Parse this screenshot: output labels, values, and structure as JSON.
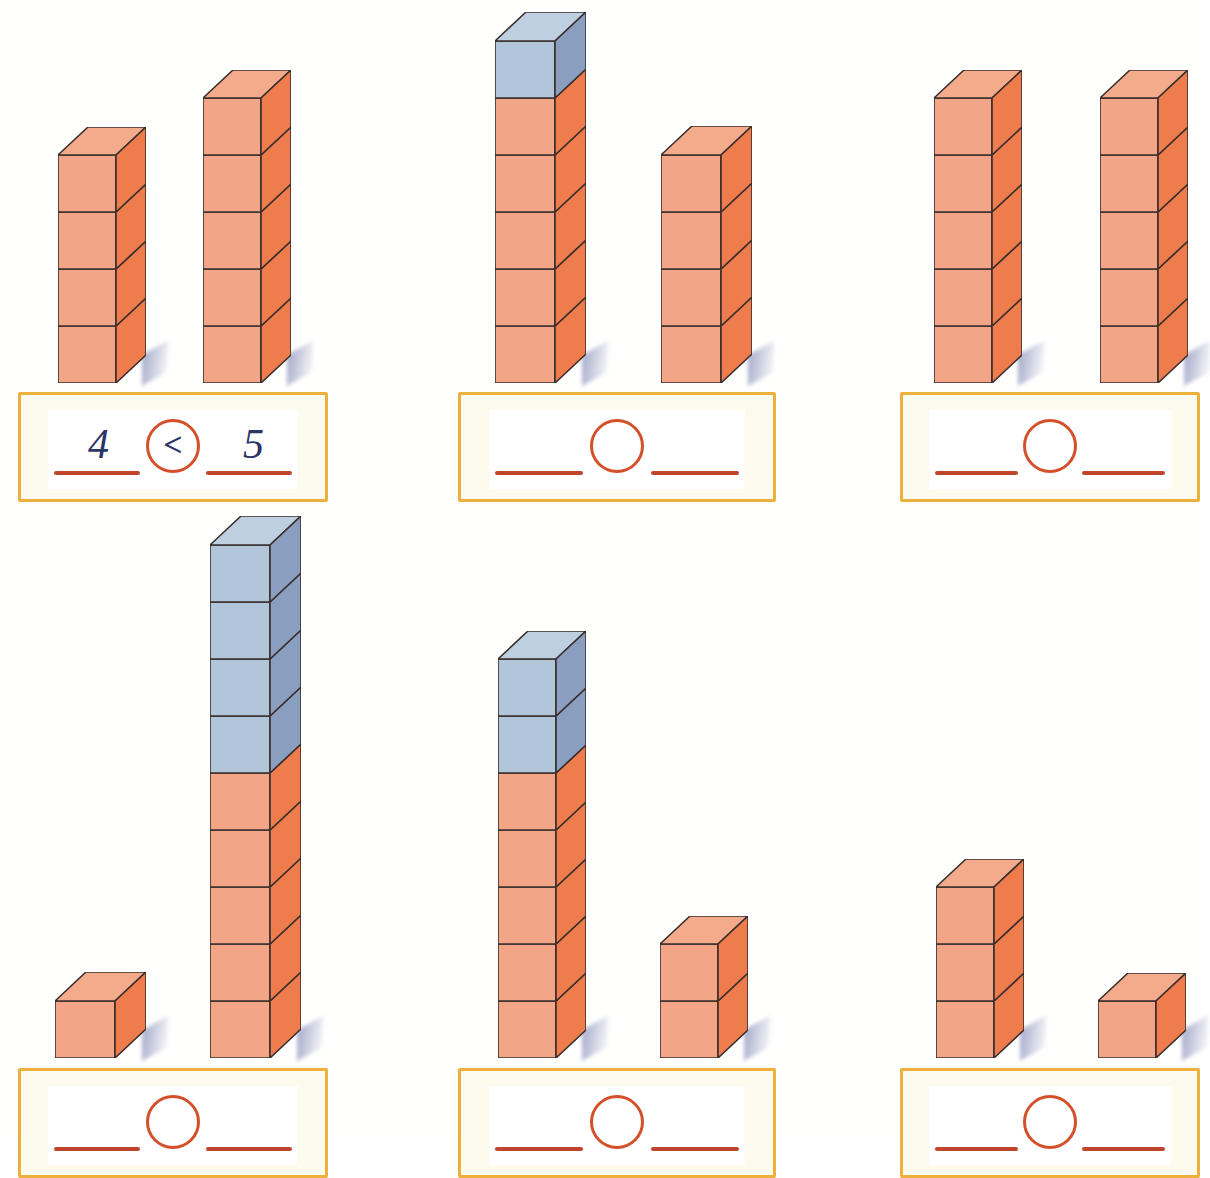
{
  "page": {
    "background_color": "#ffffff"
  },
  "palette": {
    "orange_front": "#f2a687",
    "orange_side": "#ef7c4c",
    "orange_top": "#f3ab8c",
    "blue_front": "#b2c6da",
    "blue_side": "#8a9fc0",
    "blue_top": "#bdcfe0",
    "outline": "#3a2f2c",
    "box_border": "#eeb03c",
    "box_fill": "#fdfbee",
    "blank_line": "#c0452a",
    "circle_stroke": "#d4502a",
    "ink": "#2b3566",
    "shadow": "#6a74a8"
  },
  "chart_data": {
    "type": "bar",
    "xlabel": "",
    "ylabel": "number of cubes",
    "categories": [
      "1-left",
      "1-right",
      "2-left",
      "2-right",
      "3-left",
      "3-right",
      "4-left",
      "4-right",
      "5-left",
      "5-right",
      "6-left",
      "6-right"
    ],
    "values": [
      4,
      5,
      6,
      4,
      5,
      5,
      1,
      9,
      7,
      2,
      3,
      1
    ],
    "series": [
      {
        "name": "orange cubes",
        "values": [
          4,
          5,
          5,
          4,
          5,
          5,
          1,
          5,
          5,
          2,
          3,
          1
        ]
      },
      {
        "name": "blue cubes",
        "values": [
          0,
          0,
          1,
          0,
          0,
          0,
          0,
          4,
          2,
          0,
          0,
          0
        ]
      }
    ],
    "legend": [
      "orange cubes",
      "blue cubes"
    ],
    "grid": false,
    "ylim": [
      0,
      9
    ]
  },
  "exercises": [
    {
      "id": "exercise-1",
      "left_tower": {
        "orange": 4,
        "blue": 0,
        "total": 4
      },
      "right_tower": {
        "orange": 5,
        "blue": 0,
        "total": 5
      },
      "answer": {
        "left_value": "4",
        "operator": "<",
        "right_value": "5",
        "filled": true
      }
    },
    {
      "id": "exercise-2",
      "left_tower": {
        "orange": 5,
        "blue": 1,
        "total": 6
      },
      "right_tower": {
        "orange": 4,
        "blue": 0,
        "total": 4
      },
      "answer": {
        "left_value": "",
        "operator": "",
        "right_value": "",
        "filled": false
      }
    },
    {
      "id": "exercise-3",
      "left_tower": {
        "orange": 5,
        "blue": 0,
        "total": 5
      },
      "right_tower": {
        "orange": 5,
        "blue": 0,
        "total": 5
      },
      "answer": {
        "left_value": "",
        "operator": "",
        "right_value": "",
        "filled": false
      }
    },
    {
      "id": "exercise-4",
      "left_tower": {
        "orange": 1,
        "blue": 0,
        "total": 1
      },
      "right_tower": {
        "orange": 5,
        "blue": 4,
        "total": 9
      },
      "answer": {
        "left_value": "",
        "operator": "",
        "right_value": "",
        "filled": false
      }
    },
    {
      "id": "exercise-5",
      "left_tower": {
        "orange": 5,
        "blue": 2,
        "total": 7
      },
      "right_tower": {
        "orange": 2,
        "blue": 0,
        "total": 2
      },
      "answer": {
        "left_value": "",
        "operator": "",
        "right_value": "",
        "filled": false
      }
    },
    {
      "id": "exercise-6",
      "left_tower": {
        "orange": 3,
        "blue": 0,
        "total": 3
      },
      "right_tower": {
        "orange": 1,
        "blue": 0,
        "total": 1
      },
      "answer": {
        "left_value": "",
        "operator": "",
        "right_value": "",
        "filled": false
      }
    }
  ]
}
